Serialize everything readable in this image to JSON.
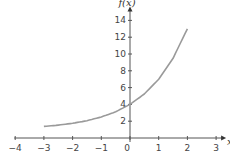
{
  "corner_label": ")",
  "chart_data": {
    "type": "line",
    "title": "",
    "xlabel": "x",
    "ylabel": "f(x)",
    "xlim": [
      -4,
      3
    ],
    "ylim": [
      0,
      14
    ],
    "grid": false,
    "legend": null,
    "x_ticks": [
      -4,
      -3,
      -2,
      -1,
      0,
      1,
      2,
      3
    ],
    "x_tick_labels": [
      "−4",
      "−3",
      "−2",
      "−1",
      "0",
      "1",
      "2",
      "3"
    ],
    "y_ticks": [
      2,
      4,
      6,
      8,
      10,
      12,
      14
    ],
    "y_tick_labels": [
      "2",
      "4",
      "6",
      "8",
      "10",
      "12",
      "14"
    ],
    "series": [
      {
        "name": "f(x)",
        "color": "#9a9a9a",
        "x": [
          -3,
          -2.5,
          -2,
          -1.5,
          -1,
          -0.5,
          0,
          0.5,
          1,
          1.5,
          2
        ],
        "values": [
          1.38,
          1.53,
          1.75,
          2.06,
          2.5,
          3.12,
          4.0,
          5.24,
          7.0,
          9.49,
          13.0
        ]
      }
    ],
    "axis_color": "#555555"
  }
}
